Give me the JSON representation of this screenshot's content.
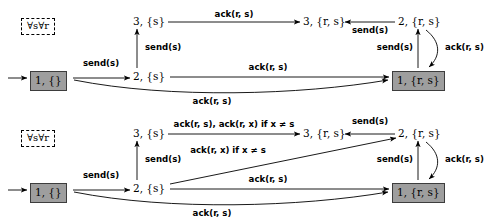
{
  "figure": {
    "type": "state-transition-diagram",
    "panel_count": 2
  },
  "symbols": {
    "quantifier": "∀s∀r",
    "send": "send",
    "ack": "ack",
    "neq": "≠"
  },
  "panels": [
    {
      "id": "top",
      "quantifier_box": "∀s∀r",
      "nodes": [
        {
          "id": "t-init",
          "label": "1, {}",
          "style": "boxed",
          "x": 30,
          "y": 71
        },
        {
          "id": "t-2s",
          "label": "2, {s}",
          "style": "plain",
          "x": 133,
          "y": 71
        },
        {
          "id": "t-3s",
          "label": "3, {s}",
          "style": "plain",
          "x": 133,
          "y": 16
        },
        {
          "id": "t-3rs",
          "label": "3, {r, s}",
          "style": "plain",
          "x": 303,
          "y": 16
        },
        {
          "id": "t-2rs",
          "label": "2, {r, s}",
          "style": "plain",
          "x": 398,
          "y": 16
        },
        {
          "id": "t-1rs",
          "label": "1, {r, s}",
          "style": "boxed",
          "x": 392,
          "y": 71
        }
      ],
      "edges": [
        {
          "id": "t-e-start",
          "label": "",
          "from": "entry",
          "to": "t-init"
        },
        {
          "id": "t-e1",
          "label": "send(s)",
          "from": "t-init",
          "to": "t-2s"
        },
        {
          "id": "t-e2",
          "label": "send(s)",
          "from": "t-2s",
          "to": "t-3s"
        },
        {
          "id": "t-e3",
          "label": "ack(r, s)",
          "from": "t-3s",
          "to": "t-3rs"
        },
        {
          "id": "t-e4",
          "label": "send(s)",
          "from": "t-2rs",
          "to": "t-3rs"
        },
        {
          "id": "t-e5",
          "label": "send(s)",
          "from": "t-1rs",
          "to": "t-2rs"
        },
        {
          "id": "t-e6",
          "label": "ack(r, s)",
          "from": "t-2rs",
          "to": "t-1rs"
        },
        {
          "id": "t-e7",
          "label": "ack(r, s)",
          "from": "t-2s",
          "to": "t-1rs"
        },
        {
          "id": "t-e8",
          "label": "ack(r, s)",
          "from": "t-init",
          "to": "t-1rs"
        }
      ],
      "labels": {
        "send_init_2s": "send(s)",
        "send_2s_3s": "send(s)",
        "ack_3s_3rs": "ack(r, s)",
        "send_2rs_3rs": "send(s)",
        "send_1rs_2rs": "send(s)",
        "ack_2rs_1rs": "ack(r, s)",
        "ack_2s_1rs": "ack(r, s)",
        "ack_init_1rs": "ack(r, s)"
      }
    },
    {
      "id": "bottom",
      "quantifier_box": "∀s∀r",
      "nodes": [
        {
          "id": "b-init",
          "label": "1, {}",
          "style": "boxed",
          "x": 30,
          "y": 71
        },
        {
          "id": "b-2s",
          "label": "2, {s}",
          "style": "plain",
          "x": 133,
          "y": 71
        },
        {
          "id": "b-3s",
          "label": "3, {s}",
          "style": "plain",
          "x": 133,
          "y": 16
        },
        {
          "id": "b-3rs",
          "label": "3, {r, s}",
          "style": "plain",
          "x": 303,
          "y": 16
        },
        {
          "id": "b-2rs",
          "label": "2, {r, s}",
          "style": "plain",
          "x": 398,
          "y": 16
        },
        {
          "id": "b-1rs",
          "label": "1, {r, s}",
          "style": "boxed",
          "x": 392,
          "y": 71
        }
      ],
      "edges": [
        {
          "id": "b-e-start",
          "label": "",
          "from": "entry",
          "to": "b-init"
        },
        {
          "id": "b-e1",
          "label": "send(s)",
          "from": "b-init",
          "to": "b-2s"
        },
        {
          "id": "b-e2",
          "label": "send(s)",
          "from": "b-2s",
          "to": "b-3s"
        },
        {
          "id": "b-e3",
          "label": "ack(r, s), ack(r, x) if x ≠ s",
          "from": "b-3s",
          "to": "b-3rs"
        },
        {
          "id": "b-e4",
          "label": "ack(r, x) if x ≠ s",
          "from": "b-2s",
          "to": "b-2rs"
        },
        {
          "id": "b-e5",
          "label": "send(s)",
          "from": "b-2rs",
          "to": "b-3rs"
        },
        {
          "id": "b-e6",
          "label": "send(s)",
          "from": "b-1rs",
          "to": "b-2rs"
        },
        {
          "id": "b-e7",
          "label": "ack(r, s)",
          "from": "b-2rs",
          "to": "b-1rs"
        },
        {
          "id": "b-e8",
          "label": "ack(r, s)",
          "from": "b-2s",
          "to": "b-1rs"
        },
        {
          "id": "b-e9",
          "label": "ack(r, s)",
          "from": "b-init",
          "to": "b-1rs"
        }
      ],
      "labels": {
        "send_init_2s": "send(s)",
        "send_2s_3s": "send(s)",
        "ack_3s_3rs": "ack(r, s), ack(r, x) if x ≠ s",
        "ack_2s_2rs": "ack(r, x) if x ≠ s",
        "send_2rs_3rs": "send(s)",
        "send_1rs_2rs": "send(s)",
        "ack_2rs_1rs": "ack(r, s)",
        "ack_2s_1rs": "ack(r, s)",
        "ack_init_1rs": "ack(r, s)"
      }
    }
  ]
}
